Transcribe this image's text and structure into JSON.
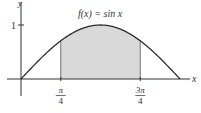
{
  "chart_data": {
    "type": "area",
    "title": "f(x) = sin x",
    "function": "sin x",
    "xlabel": "x",
    "ylabel": "y",
    "xlim": [
      0,
      3.14159
    ],
    "ylim": [
      0,
      1
    ],
    "y_ticks": [
      {
        "value": 1,
        "label": "1"
      }
    ],
    "x_ticks": [
      {
        "value": 0.785398,
        "numerator": "π",
        "denominator": "4"
      },
      {
        "value": 2.356194,
        "numerator": "3π",
        "denominator": "4"
      }
    ],
    "shaded_region": {
      "from": 0.785398,
      "to": 2.356194,
      "color": "#d9d9d9"
    },
    "curve_color": "#2b2b2b",
    "grid": false
  }
}
